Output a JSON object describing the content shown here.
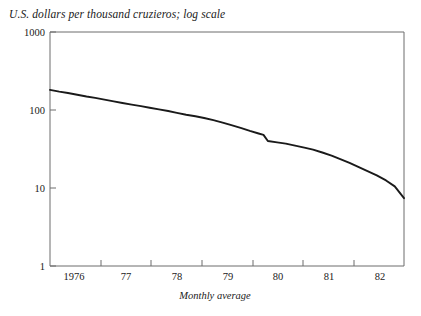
{
  "chart_data": {
    "type": "line",
    "title": "U.S. dollars per thousand cruzieros; log scale",
    "xlabel": "Monthly average",
    "ylabel": "",
    "yscale": "log",
    "ylim": [
      1,
      1000
    ],
    "xlim": [
      1976.0,
      1982.5
    ],
    "grid": false,
    "legend": "none",
    "ytick_labels": [
      "1000",
      "100",
      "10",
      "1"
    ],
    "ytick_values": [
      1000,
      100,
      10,
      1
    ],
    "xtick_labels": [
      "1976",
      "77",
      "78",
      "79",
      "80",
      "81",
      "82"
    ],
    "xtick_values": [
      1976,
      1977,
      1978,
      1979,
      1980,
      1981,
      1982
    ],
    "series": [
      {
        "name": "U.S. dollars per thousand cruzieros",
        "x": [
          1976.0,
          1976.17,
          1976.33,
          1976.5,
          1976.67,
          1976.83,
          1977.0,
          1977.17,
          1977.33,
          1977.5,
          1977.67,
          1977.83,
          1978.0,
          1978.17,
          1978.33,
          1978.5,
          1978.67,
          1978.83,
          1979.0,
          1979.17,
          1979.33,
          1979.5,
          1979.67,
          1979.83,
          1979.92,
          1980.0,
          1980.17,
          1980.33,
          1980.5,
          1980.67,
          1980.83,
          1981.0,
          1981.17,
          1981.33,
          1981.5,
          1981.67,
          1981.83,
          1982.0,
          1982.17,
          1982.33,
          1982.5
        ],
        "y": [
          181,
          172,
          165,
          157,
          149,
          143,
          136,
          129,
          123,
          117,
          112,
          107,
          102,
          97,
          92,
          87,
          83,
          79,
          74,
          69,
          64,
          59,
          54,
          50,
          48,
          40,
          38.5,
          37,
          35,
          33,
          31,
          28.5,
          26,
          23.5,
          21,
          18.5,
          16.5,
          14.5,
          12.5,
          10.5,
          7.4
        ]
      }
    ],
    "annotations": [
      {
        "label": "December 1979 maxi-devaluation step",
        "x": 1979.95,
        "y_from": 48,
        "y_to": 40
      }
    ]
  },
  "axes": {
    "plot_left_px": 50,
    "plot_right_px": 404,
    "plot_top_px": 32,
    "plot_bottom_px": 266
  },
  "colors": {
    "line": "#1a1a1a",
    "frame": "#6d6d6d",
    "background": "#ffffff",
    "text": "#1a1a1a"
  }
}
